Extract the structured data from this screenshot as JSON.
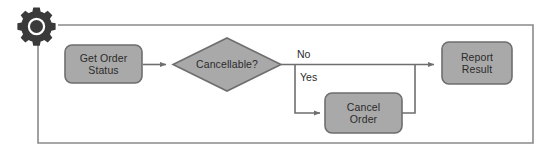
{
  "diagram": {
    "type": "flowchart",
    "colors": {
      "node_fill": "#a9a9a9",
      "node_stroke": "#6e6e6e",
      "connector": "#6e6e6e",
      "loop_line": "#8a8a8a",
      "text": "#2b2b2b",
      "gear": "#3a3a3a",
      "background": "#ffffff"
    },
    "start_marker": {
      "icon": "gear-icon",
      "label": "Start"
    },
    "nodes": [
      {
        "id": "get-order-status",
        "shape": "rounded-rect",
        "line1": "Get Order",
        "line2": "Status"
      },
      {
        "id": "cancellable",
        "shape": "diamond",
        "line1": "Cancellable?",
        "line2": ""
      },
      {
        "id": "cancel-order",
        "shape": "rounded-rect",
        "line1": "Cancel",
        "line2": "Order"
      },
      {
        "id": "report-result",
        "shape": "rounded-rect",
        "line1": "Report",
        "line2": "Result"
      }
    ],
    "edges": [
      {
        "id": "start-to-get-order-status",
        "label": ""
      },
      {
        "id": "get-order-status-to-cancellable",
        "label": ""
      },
      {
        "id": "cancellable-to-report-result",
        "label": "No"
      },
      {
        "id": "cancellable-to-cancel-order",
        "label": "Yes"
      },
      {
        "id": "cancel-order-to-report-result",
        "label": ""
      },
      {
        "id": "report-result-loop-back",
        "label": ""
      }
    ]
  }
}
